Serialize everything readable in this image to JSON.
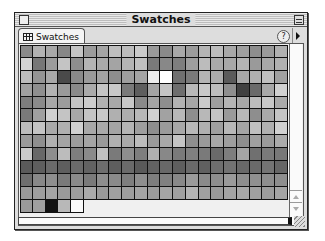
{
  "window": {
    "title": "Swatches"
  },
  "tab": {
    "label": "Swatches",
    "icon": "grid-icon"
  },
  "toolbar": {
    "help_label": "?",
    "help_icon": "help-icon",
    "menu_icon": "palette-menu-arrow-icon"
  },
  "swatches": {
    "columns": 21,
    "rows": [
      [
        "#8a8a8a",
        "#b2b2b2",
        "#a8a8a8",
        "#878787",
        "#c4c4c4",
        "#9c9c9c",
        "#a4a4a4",
        "#bebebe",
        "#bcbcbc",
        "#cacaca",
        "#9a9a9a",
        "#8a8a8a",
        "#a8a8a8",
        "#9c9c9c",
        "#b4b4b4",
        "#bcbcbc",
        "#a8a8a8",
        "#a0a0a0",
        "#8e8e8e",
        "#9a9a9a",
        "#b0b0b0"
      ],
      [
        "#d4d4d4",
        "#777777",
        "#9c9c9c",
        "#c4c4c4",
        "#8e8e8e",
        "#b4b4b4",
        "#aaaaaa",
        "#a4a4a4",
        "#b4b4b4",
        "#c0c0c0",
        "#7a7a7a",
        "#888888",
        "#7e7e7e",
        "#9e9e9e",
        "#bcbcbc",
        "#aaaaaa",
        "#a8a8a8",
        "#b4b4b4",
        "#9a9a9a",
        "#a8a8a8",
        "#b0b0b0"
      ],
      [
        "#bcbcbc",
        "#949494",
        "#a8a8a8",
        "#4a4a4a",
        "#8a8a8a",
        "#9a9a9a",
        "#a2a2a2",
        "#8e8e8e",
        "#9e9e9e",
        "#a4a4a4",
        "#ececec",
        "#ffffff",
        "#707070",
        "#7a7a7a",
        "#b4b4b4",
        "#acacac",
        "#5a5a5a",
        "#a8a8a8",
        "#b0b0b0",
        "#c0c0c0",
        "#a0a0a0"
      ],
      [
        "#a0a0a0",
        "#8e8e8e",
        "#b2b2b2",
        "#9a9a9a",
        "#8a8a8a",
        "#aaaaaa",
        "#c4c4c4",
        "#c8c8c8",
        "#7a7a7a",
        "#5e5e5e",
        "#a4a4a4",
        "#c4c4c4",
        "#6e6e6e",
        "#b8b8b8",
        "#c8c8c8",
        "#bcbcbc",
        "#8e8e8e",
        "#404040",
        "#6a6a6a",
        "#a8a8a8",
        "#d0d0d0"
      ],
      [
        "#7e7e7e",
        "#8a8a8a",
        "#a8a8a8",
        "#9c9c9c",
        "#c4c4c4",
        "#cccccc",
        "#b0b0b0",
        "#a8a8a8",
        "#c8c8c8",
        "#8a8a8a",
        "#a4a4a4",
        "#8e8e8e",
        "#b2b2b2",
        "#a6a6a6",
        "#cacaca",
        "#9e9e9e",
        "#b4b4b4",
        "#a8a8a8",
        "#bcbcbc",
        "#c8c8c8",
        "#aaaaaa"
      ],
      [
        "#7a7a7a",
        "#a0a0a0",
        "#d0d0d0",
        "#c4c4c4",
        "#a8a8a8",
        "#c4c4c4",
        "#c8c8c8",
        "#b0b0b0",
        "#aeaeae",
        "#b8b8b8",
        "#d0d0d0",
        "#a2a2a2",
        "#b8b8b8",
        "#8e8e8e",
        "#b8b8b8",
        "#c4c4c4",
        "#9a9a9a",
        "#b8b8b8",
        "#8e8e8e",
        "#aaaaaa",
        "#c4c4c4"
      ],
      [
        "#bcbcbc",
        "#c4c4c4",
        "#aaaaaa",
        "#b0b0b0",
        "#d0d0d0",
        "#a8a8a8",
        "#aaaaaa",
        "#a4a4a4",
        "#b4b4b4",
        "#9e9e9e",
        "#8e8e8e",
        "#9a9a9a",
        "#a8a8a8",
        "#b8b8b8",
        "#b0b0b0",
        "#a0a0a0",
        "#b8b8b8",
        "#a4a4a4",
        "#c0c0c0",
        "#b0b0b0",
        "#d0d0d0"
      ],
      [
        "#9a9a9a",
        "#8e8e8e",
        "#b0b0b0",
        "#a4a4a4",
        "#9c9c9c",
        "#a4a4a4",
        "#9a9a9a",
        "#b0b0b0",
        "#aaaaaa",
        "#bcbcbc",
        "#9a9a9a",
        "#a8a8a8",
        "#c4c4c4",
        "#8e8e8e",
        "#9a9a9a",
        "#a8a8a8",
        "#9e9e9e",
        "#8e8e8e",
        "#a0a0a0",
        "#9a9a9a",
        "#aaaaaa"
      ],
      [
        "#cacaca",
        "#686868",
        "#8e8e8e",
        "#bcbcbc",
        "#7e7e7e",
        "#8a8a8a",
        "#c0c0c0",
        "#7a7a7a",
        "#8e8e8e",
        "#7e7e7e",
        "#b0b0b0",
        "#888888",
        "#7a7a7a",
        "#808080",
        "#7a7a7a",
        "#6a6a6a",
        "#7e7e7e",
        "#a4a4a4",
        "#707070",
        "#7a7a7a",
        "#787878"
      ],
      [
        "#5a5a5a",
        "#5e5e5e",
        "#6a6a6a",
        "#5e5e5e",
        "#6a6a6a",
        "#626262",
        "#6e6e6e",
        "#5e5e5e",
        "#6a6a6a",
        "#5a5a5a",
        "#626262",
        "#686868",
        "#5e5e5e",
        "#6a6a6a",
        "#606060",
        "#6e6e6e",
        "#727272",
        "#686868",
        "#6a6a6a",
        "#747474",
        "#666666"
      ],
      [
        "#6e6e6e",
        "#888888",
        "#8e8e8e",
        "#7a7a7a",
        "#8a8a8a",
        "#7a7a7a",
        "#8e8e8e",
        "#8a8a8a",
        "#7e7e7e",
        "#8e8e8e",
        "#7e7e7e",
        "#808080",
        "#888888",
        "#9a9a9a",
        "#8a8a8a",
        "#8e8e8e",
        "#9a9a9a",
        "#8e8e8e",
        "#909090",
        "#8e8e8e",
        "#8e8e8e"
      ],
      [
        "#9a9a9a",
        "#9e9e9e",
        "#a4a4a4",
        "#9a9a9a",
        "#9e9e9e",
        "#aaaaaa",
        "#9a9a9a",
        "#a0a0a0",
        "#9e9e9e",
        "#a4a4a4",
        "#9c9c9c",
        "#a4a4a4",
        "#a0a0a0",
        "#b4b4b4",
        "#a0a0a0",
        "#9a9a9a",
        "#a4a4a4",
        "#a8a8a8",
        "#a0a0a0",
        "#9c9c9c",
        "#a4a4a4"
      ],
      [
        "#9a9a9a",
        "#a0a0a0",
        "#111111",
        "#b8b8b8",
        "#fafafa"
      ]
    ]
  }
}
